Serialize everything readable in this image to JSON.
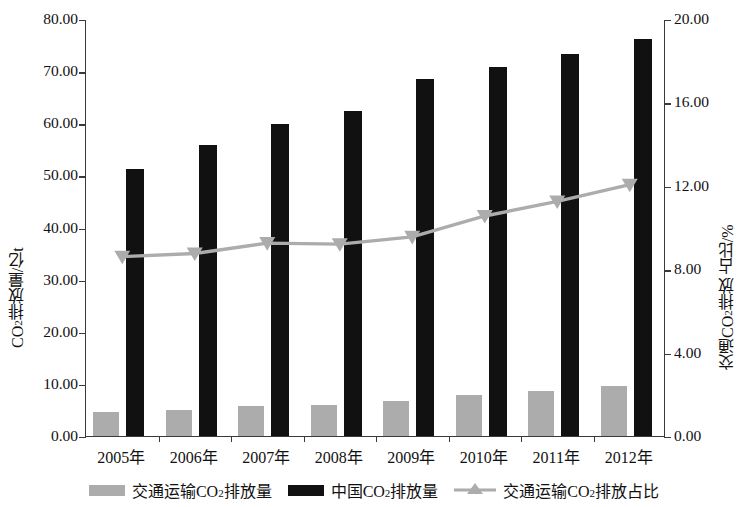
{
  "chart_data": {
    "type": "bar",
    "title": "",
    "xlabel": "",
    "categories": [
      "2005年",
      "2006年",
      "2007年",
      "2008年",
      "2009年",
      "2010年",
      "2011年",
      "2012年"
    ],
    "series": [
      {
        "name": "交通运输CO2排放量",
        "type": "bar",
        "axis": "left",
        "color": "#acacac",
        "values": [
          4.7,
          5.0,
          5.8,
          5.9,
          6.7,
          7.8,
          8.6,
          9.6
        ]
      },
      {
        "name": "中国CO2排放量",
        "type": "bar",
        "axis": "left",
        "color": "#111111",
        "values": [
          51.3,
          55.8,
          59.8,
          62.4,
          68.4,
          70.7,
          73.3,
          76.2
        ]
      },
      {
        "name": "交通运输CO2排放占比",
        "type": "line",
        "axis": "right",
        "color": "#acacac",
        "marker": "triangle",
        "values": [
          8.65,
          8.8,
          9.3,
          9.25,
          9.6,
          10.6,
          11.3,
          12.1
        ]
      }
    ],
    "left_axis": {
      "label": "CO2排放量/亿t",
      "label_html": "CO<sub>2</sub>排放量/亿t",
      "min": 0,
      "max": 80,
      "step": 10,
      "ticks": [
        "0.00",
        "10.00",
        "20.00",
        "30.00",
        "40.00",
        "50.00",
        "60.00",
        "70.00",
        "80.00"
      ]
    },
    "right_axis": {
      "label": "交通CO2排放 占比/%",
      "label_html": "交通CO<sub>2</sub>排放 占比/%",
      "min": 0,
      "max": 20,
      "step": 4,
      "ticks": [
        "0.00",
        "4.00",
        "8.00",
        "12.00",
        "16.00",
        "20.00"
      ]
    },
    "grid": false,
    "legend_position": "bottom"
  },
  "legend": {
    "items": [
      {
        "label": "交通运输CO2排放量",
        "marker": "gray-square"
      },
      {
        "label": "中国CO2排放量",
        "marker": "black-square"
      },
      {
        "label": "交通运输CO2排放占比",
        "marker": "gray-line-triangle"
      }
    ]
  }
}
